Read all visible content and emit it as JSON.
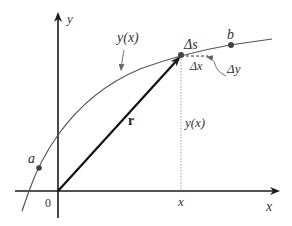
{
  "diagram": {
    "title": "",
    "axes": {
      "x_label": "x",
      "y_label": "y",
      "origin_label": "0"
    },
    "curve": {
      "label": "y(x)",
      "start_point_label": "a",
      "end_point_label": "b"
    },
    "vector": {
      "label": "r"
    },
    "increments": {
      "arc_label": "Δs",
      "dx_label": "Δx",
      "dy_label": "Δy"
    },
    "projection": {
      "height_label": "y(x)",
      "foot_label": "x"
    },
    "colors": {
      "axis": "#1a1a1a",
      "curve": "#555555",
      "vector": "#111111",
      "dotted": "#999999",
      "text": "#333333"
    }
  }
}
